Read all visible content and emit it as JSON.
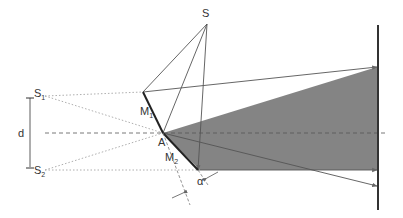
{
  "diagram": {
    "labels": {
      "source": "S",
      "image1": "S",
      "image1_sub": "1",
      "image2": "S",
      "image2_sub": "2",
      "mirror1": "M",
      "mirror1_sub": "1",
      "mirror2": "M",
      "mirror2_sub": "2",
      "junction": "A",
      "separation": "d",
      "angle": "α"
    },
    "colors": {
      "line": "#555555",
      "dotted": "#999999",
      "mirror": "#222222",
      "fill": "#777777",
      "screen": "#333333"
    }
  }
}
